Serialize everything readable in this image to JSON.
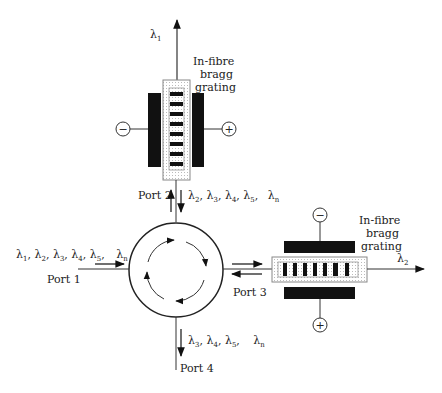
{
  "diagram": {
    "colors": {
      "line": "#333333",
      "plate": "#111111",
      "grating_box": "#888888",
      "background": "#ffffff"
    },
    "top_grating": {
      "label_lines": [
        "In-fibre",
        "bragg",
        "grating"
      ],
      "output_wavelength": {
        "symbol": "λ",
        "sub": "1"
      },
      "electrode_left_sign": "−",
      "electrode_right_sign": "+"
    },
    "right_grating": {
      "label_lines": [
        "In-fibre",
        "bragg",
        "grating"
      ],
      "output_wavelength": {
        "symbol": "λ",
        "sub": "2"
      },
      "electrode_top_sign": "−",
      "electrode_bottom_sign": "+"
    },
    "circulator": {
      "ports": {
        "port1": "Port 1",
        "port2": "Port 2",
        "port3": "Port 3",
        "port4": "Port 4"
      }
    },
    "signals": {
      "port1_input": [
        {
          "symbol": "λ",
          "sub": "1",
          "sep": ","
        },
        {
          "symbol": "λ",
          "sub": "2",
          "sep": ","
        },
        {
          "symbol": "λ",
          "sub": "3",
          "sep": ","
        },
        {
          "symbol": "λ",
          "sub": "4",
          "sep": ","
        },
        {
          "symbol": "λ",
          "sub": "5",
          "sep": ","
        },
        {
          "symbol": "λ",
          "sub": "n",
          "sep": ""
        }
      ],
      "port2_down": [
        {
          "symbol": "λ",
          "sub": "2",
          "sep": ","
        },
        {
          "symbol": "λ",
          "sub": "3",
          "sep": ","
        },
        {
          "symbol": "λ",
          "sub": "4",
          "sep": ","
        },
        {
          "symbol": "λ",
          "sub": "5",
          "sep": ","
        },
        {
          "symbol": "λ",
          "sub": "n",
          "sep": ""
        }
      ],
      "port4_output": [
        {
          "symbol": "λ",
          "sub": "3",
          "sep": ","
        },
        {
          "symbol": "λ",
          "sub": "4",
          "sep": ","
        },
        {
          "symbol": "λ",
          "sub": "5",
          "sep": ","
        },
        {
          "symbol": "λ",
          "sub": "n",
          "sep": ""
        }
      ]
    }
  }
}
